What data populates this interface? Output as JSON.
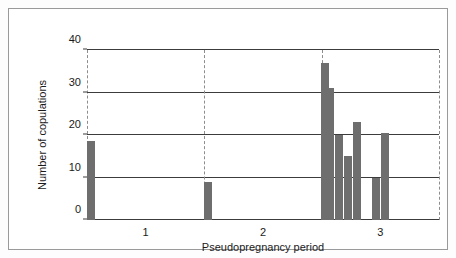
{
  "figure": {
    "background_color": "#ffffff",
    "frame_color": "#9a9a9a",
    "bar_color": "#6e6e6e",
    "grid_color": "#3c3c3c",
    "dash_color": "#8d8d8d"
  },
  "chart_data": {
    "type": "bar",
    "title": "",
    "subtitle": "",
    "xlabel": "Pseudopregnancy period",
    "ylabel": "Number of copulations",
    "xlim": [
      0.5,
      3.5
    ],
    "ylim": [
      0,
      40
    ],
    "ytick_labels": [
      "0",
      "10",
      "20",
      "30",
      "40"
    ],
    "ytick_values": [
      0,
      10,
      20,
      30,
      40
    ],
    "xtick_labels": [
      "1",
      "2",
      "3"
    ],
    "xtick_values": [
      1,
      2,
      3
    ],
    "grid": "horizontal-solid-at-y-ticks; vertical-dashed-period-separators",
    "legend": "none",
    "annotations": [],
    "period_separators": [
      0.5,
      1.5,
      2.5,
      3.5
    ],
    "series": [
      {
        "name": "Number of copulations",
        "bars": [
          {
            "period": 1,
            "x": 0.53,
            "value": 18.5
          },
          {
            "period": 2,
            "x": 1.53,
            "value": 9
          },
          {
            "period": 3,
            "x": 2.525,
            "value": 37
          },
          {
            "period": 3,
            "x": 2.575,
            "value": 31
          },
          {
            "period": 3,
            "x": 2.645,
            "value": 20
          },
          {
            "period": 3,
            "x": 2.725,
            "value": 15
          },
          {
            "period": 3,
            "x": 2.805,
            "value": 23
          },
          {
            "period": 3,
            "x": 2.96,
            "value": 10
          },
          {
            "period": 3,
            "x": 3.04,
            "value": 20.5
          }
        ]
      }
    ]
  }
}
